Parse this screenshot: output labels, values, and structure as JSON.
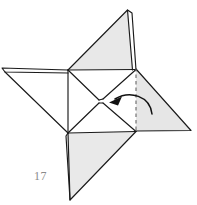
{
  "figure": {
    "step_number": "17",
    "colors": {
      "paper_shaded": "#e6e6e6",
      "paper_shaded_alt": "#ececec",
      "paper_white": "#ffffff",
      "line": "#1a1a1a",
      "crease_dashed": "#6b6b6b",
      "arrow": "#111111",
      "label_text": "#8a8a8a",
      "background": "#ffffff"
    },
    "geometry": {
      "center_square": [
        [
          68,
          70
        ],
        [
          136,
          70
        ],
        [
          136,
          131
        ],
        [
          68,
          133
        ]
      ],
      "flaps": [
        {
          "name": "top-flap",
          "shaded": true,
          "points": [
            [
              68,
              70
            ],
            [
              128,
              10
            ],
            [
              136,
              70
            ]
          ]
        },
        {
          "name": "left-flap",
          "shaded": false,
          "points": [
            [
              68,
              70
            ],
            [
              2,
              68
            ],
            [
              68,
              133
            ]
          ]
        },
        {
          "name": "right-flap",
          "shaded": true,
          "points": [
            [
              136,
              70
            ],
            [
              191,
              130
            ],
            [
              136,
              131
            ]
          ]
        },
        {
          "name": "bottom-flap",
          "shaded": true,
          "points": [
            [
              68,
              133
            ],
            [
              136,
              131
            ],
            [
              70,
              200
            ]
          ]
        }
      ],
      "dashed_crease": {
        "x": 136,
        "y1": 68,
        "y2": 133
      },
      "arrow": {
        "path": "M 150 112 C 146 96 126 92 112 100",
        "head_at": [
          112,
          100
        ],
        "direction": "leftward"
      }
    }
  }
}
